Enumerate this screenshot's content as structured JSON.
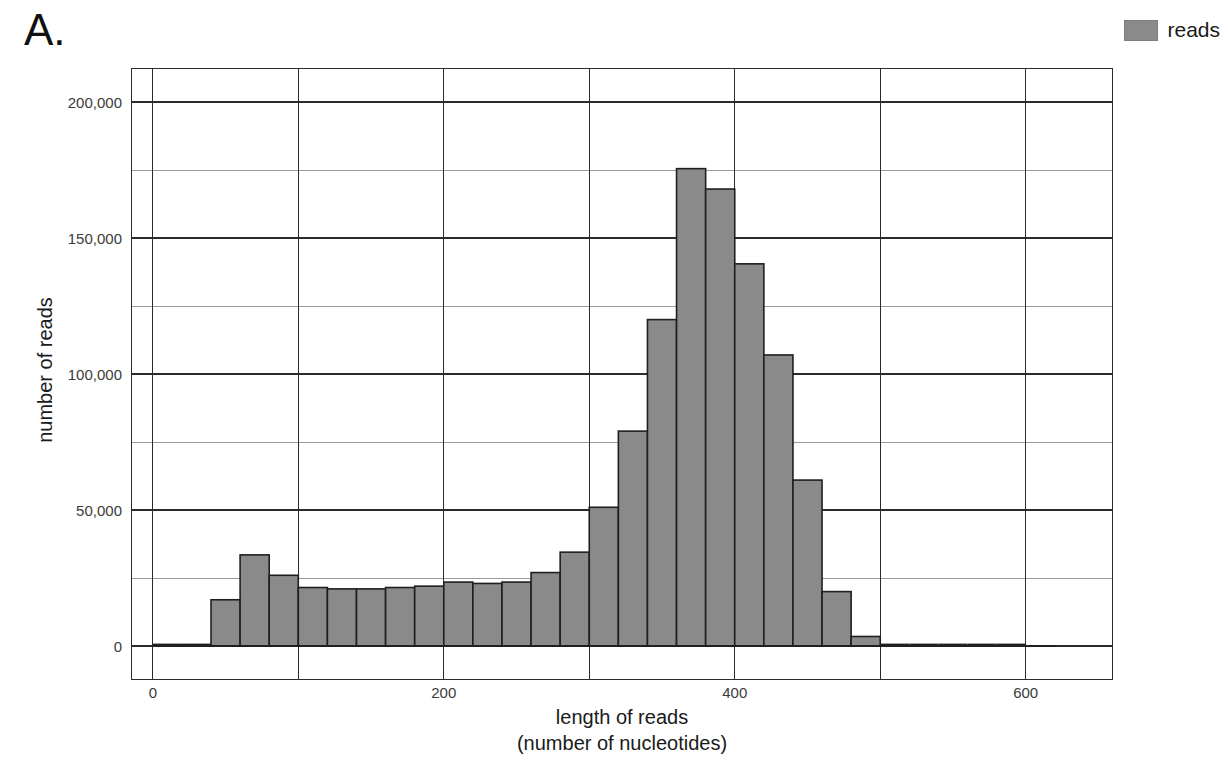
{
  "panel": {
    "letter": "A."
  },
  "legend": {
    "position": "top-right",
    "entries": [
      {
        "label": "reads",
        "color": "#8a8a8a"
      }
    ]
  },
  "chart_data": {
    "type": "bar",
    "title": "",
    "subtitle": "",
    "xlabel": "length of reads",
    "xlabel_line2": "(number of nucleotides)",
    "ylabel": "number of reads",
    "xlim": [
      -15,
      660
    ],
    "ylim": [
      -12500,
      212500
    ],
    "grid": true,
    "grid_x_major": [
      0,
      100,
      200,
      300,
      400,
      500,
      600
    ],
    "grid_y_major": [
      0,
      50000,
      100000,
      150000,
      200000
    ],
    "grid_y_minor": [
      25000,
      75000,
      125000,
      175000
    ],
    "xticks": [
      0,
      200,
      400,
      600
    ],
    "xtick_labels": [
      "0",
      "200",
      "400",
      "600"
    ],
    "yticks": [
      0,
      50000,
      100000,
      150000,
      200000
    ],
    "ytick_labels": [
      "0",
      "50,000",
      "100,000",
      "150,000",
      "200,000"
    ],
    "bin_width": 20,
    "series": [
      {
        "name": "reads",
        "color": "#8a8a8a",
        "edge_color": "#1f1f1f",
        "bins": [
          {
            "x0": 0,
            "x1": 20,
            "value": 300
          },
          {
            "x0": 20,
            "x1": 40,
            "value": 700
          },
          {
            "x0": 40,
            "x1": 60,
            "value": 17000
          },
          {
            "x0": 60,
            "x1": 80,
            "value": 33500
          },
          {
            "x0": 80,
            "x1": 100,
            "value": 26000
          },
          {
            "x0": 100,
            "x1": 120,
            "value": 21500
          },
          {
            "x0": 120,
            "x1": 140,
            "value": 21000
          },
          {
            "x0": 140,
            "x1": 160,
            "value": 21000
          },
          {
            "x0": 160,
            "x1": 180,
            "value": 21500
          },
          {
            "x0": 180,
            "x1": 200,
            "value": 22000
          },
          {
            "x0": 200,
            "x1": 220,
            "value": 23500
          },
          {
            "x0": 220,
            "x1": 240,
            "value": 23000
          },
          {
            "x0": 240,
            "x1": 260,
            "value": 23500
          },
          {
            "x0": 260,
            "x1": 280,
            "value": 27000
          },
          {
            "x0": 280,
            "x1": 300,
            "value": 34500
          },
          {
            "x0": 300,
            "x1": 320,
            "value": 51000
          },
          {
            "x0": 320,
            "x1": 340,
            "value": 79000
          },
          {
            "x0": 340,
            "x1": 360,
            "value": 120000
          },
          {
            "x0": 360,
            "x1": 380,
            "value": 175500
          },
          {
            "x0": 380,
            "x1": 400,
            "value": 168000
          },
          {
            "x0": 400,
            "x1": 420,
            "value": 140500
          },
          {
            "x0": 420,
            "x1": 440,
            "value": 107000
          },
          {
            "x0": 440,
            "x1": 460,
            "value": 61000
          },
          {
            "x0": 460,
            "x1": 480,
            "value": 20000
          },
          {
            "x0": 480,
            "x1": 500,
            "value": 3500
          },
          {
            "x0": 500,
            "x1": 520,
            "value": 500
          },
          {
            "x0": 520,
            "x1": 540,
            "value": 300
          },
          {
            "x0": 540,
            "x1": 560,
            "value": 200
          },
          {
            "x0": 560,
            "x1": 580,
            "value": 150
          },
          {
            "x0": 580,
            "x1": 600,
            "value": 100
          }
        ]
      }
    ]
  }
}
